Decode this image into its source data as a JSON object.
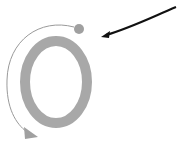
{
  "diagram": {
    "ring": {
      "cx": 56,
      "cy": 82,
      "rx": 31,
      "ry": 41,
      "stroke_width": 10,
      "color": "#a8a8a8"
    },
    "dot": {
      "cx": 79,
      "cy": 29,
      "r": 5,
      "color": "#a0a0a0"
    },
    "rotation_arrow": {
      "color": "#9a9a9a",
      "head_color": "#a0a0a0"
    },
    "pointer_arrow": {
      "color": "#111111"
    }
  }
}
